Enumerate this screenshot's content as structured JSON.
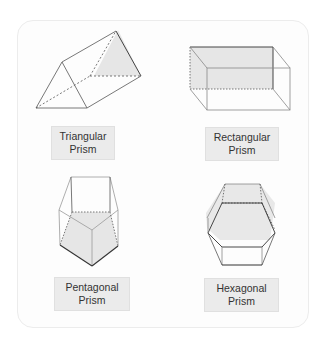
{
  "colors": {
    "face_fill": "#e6e6e6",
    "edge": "#555555",
    "label_bg": "#ebebeb"
  },
  "prisms": [
    {
      "name": "triangular",
      "label_line1": "Triangular",
      "label_line2": "Prism"
    },
    {
      "name": "rectangular",
      "label_line1": "Rectangular",
      "label_line2": "Prism"
    },
    {
      "name": "pentagonal",
      "label_line1": "Pentagonal",
      "label_line2": "Prism"
    },
    {
      "name": "hexagonal",
      "label_line1": "Hexagonal",
      "label_line2": "Prism"
    }
  ]
}
